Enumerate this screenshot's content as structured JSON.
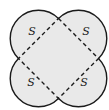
{
  "diagram": {
    "colors": {
      "fill": "#e9e9e9",
      "stroke": "#1a1a1a",
      "background": "#ffffff"
    },
    "labels": [
      {
        "id": "top-left",
        "text": "S"
      },
      {
        "id": "top-right",
        "text": "S"
      },
      {
        "id": "bottom-left",
        "text": "S"
      },
      {
        "id": "bottom-right",
        "text": "S"
      }
    ]
  }
}
